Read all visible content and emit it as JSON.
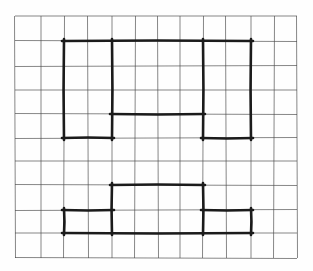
{
  "canvas": {
    "width": 313,
    "height": 271,
    "background": "#fefefe"
  },
  "grid_paper": {
    "line_color": "#4d4d4d",
    "line_width": 0.8,
    "line_opacity": 0.85,
    "columns": 12,
    "rows": 10,
    "x_lines": [
      15,
      41,
      64,
      88,
      112,
      135,
      158,
      180,
      203,
      226,
      251,
      274,
      297
    ],
    "y_lines": [
      16,
      41,
      66,
      90,
      114,
      138,
      161,
      185,
      210,
      233,
      258
    ]
  },
  "drawing": {
    "stroke_color": "#1b1b1b",
    "stroke_width": 2.6,
    "corner_overshoot": 2,
    "segments": [
      {
        "name": "top-shape-top-edge",
        "x1": 64,
        "y1": 41,
        "x2": 251,
        "y2": 41
      },
      {
        "name": "top-shape-left-edge",
        "x1": 64,
        "y1": 41,
        "x2": 64,
        "y2": 138
      },
      {
        "name": "top-shape-inner-left-vertical",
        "x1": 112,
        "y1": 41,
        "x2": 112,
        "y2": 138
      },
      {
        "name": "top-shape-middle-horizontal",
        "x1": 112,
        "y1": 114,
        "x2": 203,
        "y2": 114
      },
      {
        "name": "top-shape-inner-right-vertical",
        "x1": 203,
        "y1": 41,
        "x2": 203,
        "y2": 138
      },
      {
        "name": "top-shape-right-edge",
        "x1": 251,
        "y1": 41,
        "x2": 251,
        "y2": 138
      },
      {
        "name": "top-shape-bottom-left-edge",
        "x1": 64,
        "y1": 138,
        "x2": 112,
        "y2": 138
      },
      {
        "name": "top-shape-bottom-right-edge",
        "x1": 203,
        "y1": 138,
        "x2": 251,
        "y2": 138
      },
      {
        "name": "bottom-shape-center-top-edge",
        "x1": 112,
        "y1": 185,
        "x2": 203,
        "y2": 185
      },
      {
        "name": "bottom-shape-center-left-vertical",
        "x1": 112,
        "y1": 185,
        "x2": 112,
        "y2": 233
      },
      {
        "name": "bottom-shape-center-right-vertical",
        "x1": 203,
        "y1": 185,
        "x2": 203,
        "y2": 233
      },
      {
        "name": "bottom-shape-left-step-top",
        "x1": 64,
        "y1": 210,
        "x2": 112,
        "y2": 210
      },
      {
        "name": "bottom-shape-left-edge",
        "x1": 64,
        "y1": 210,
        "x2": 64,
        "y2": 233
      },
      {
        "name": "bottom-shape-right-step-top",
        "x1": 203,
        "y1": 210,
        "x2": 251,
        "y2": 210
      },
      {
        "name": "bottom-shape-right-edge",
        "x1": 251,
        "y1": 210,
        "x2": 251,
        "y2": 233
      },
      {
        "name": "bottom-shape-bottom-edge",
        "x1": 64,
        "y1": 233,
        "x2": 251,
        "y2": 233
      }
    ]
  }
}
